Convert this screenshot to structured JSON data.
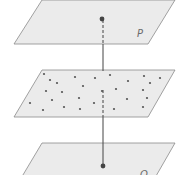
{
  "diagram": {
    "planes": [
      {
        "label": "P",
        "points": "14,44 148,44 175,0 42,0",
        "label_pos": [
          137,
          37
        ]
      },
      {
        "label": "",
        "points": "14,117 148,117 175,70 42,70"
      },
      {
        "label": "Q",
        "points": "14,190 148,190 175,143 42,143",
        "label_pos": [
          140,
          178
        ]
      }
    ],
    "line": {
      "x": 103,
      "solid_segments": [
        [
          44,
          71
        ],
        [
          117,
          165
        ]
      ],
      "dashed_segments": [
        [
          20,
          44
        ],
        [
          90,
          117
        ]
      ]
    },
    "endpoints": [
      [
        102,
        19
      ],
      [
        103,
        166
      ]
    ],
    "scatter_points": [
      [
        44,
        74
      ],
      [
        50,
        80
      ],
      [
        57,
        83
      ],
      [
        75,
        77
      ],
      [
        95,
        78
      ],
      [
        110,
        75
      ],
      [
        128,
        81
      ],
      [
        144,
        76
      ],
      [
        160,
        78
      ],
      [
        150,
        83
      ],
      [
        83,
        86
      ],
      [
        46,
        91
      ],
      [
        62,
        92
      ],
      [
        102,
        91
      ],
      [
        116,
        89
      ],
      [
        143,
        90
      ],
      [
        30,
        103
      ],
      [
        52,
        100
      ],
      [
        79,
        98
      ],
      [
        127,
        99
      ],
      [
        147,
        98
      ],
      [
        94,
        103
      ],
      [
        43,
        110
      ],
      [
        64,
        107
      ],
      [
        80,
        109
      ],
      [
        114,
        109
      ],
      [
        143,
        107
      ]
    ],
    "colors": {
      "plane_fill": "#ebebeb",
      "plane_stroke": "#8a8a8a",
      "line": "#444444",
      "dot": "#555555"
    }
  }
}
